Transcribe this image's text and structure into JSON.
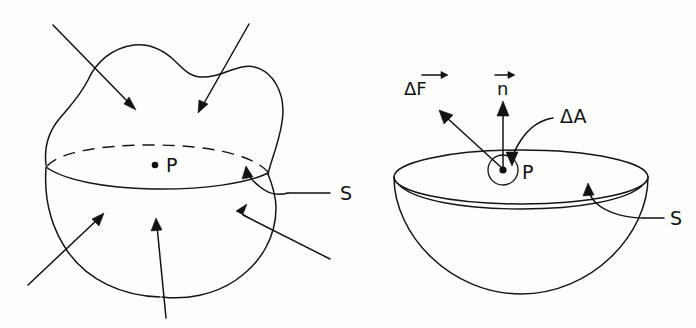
{
  "figure": {
    "background_color": "#fdfdfc",
    "ink_color": "#141414",
    "panels": [
      {
        "id": "left-panel",
        "name": "blob-cut-by-plane",
        "description": "Irregular blob-shaped body cut by a plane, lower half shown as a bowl, with six force arrows pointing toward the cut surface",
        "labels": [
          {
            "name": "point-p-label",
            "text": "P"
          },
          {
            "name": "surface-s-label",
            "text": "S"
          }
        ],
        "arrow_count": 6
      },
      {
        "id": "right-panel",
        "name": "hemispherical-bowl-with-vectors",
        "description": "Lower half of the body shown as a bowl with a small area element at P and force and normal vectors",
        "labels": [
          {
            "name": "delta-f-vector-label",
            "text": "ΔF",
            "accent": "vector-arrow"
          },
          {
            "name": "normal-vector-label",
            "text": "n",
            "accent": "vector-arrow"
          },
          {
            "name": "delta-a-label",
            "text": "ΔA"
          },
          {
            "name": "point-p-label",
            "text": "P"
          },
          {
            "name": "surface-s-label",
            "text": "S"
          }
        ],
        "arrow_count": 4
      }
    ]
  }
}
